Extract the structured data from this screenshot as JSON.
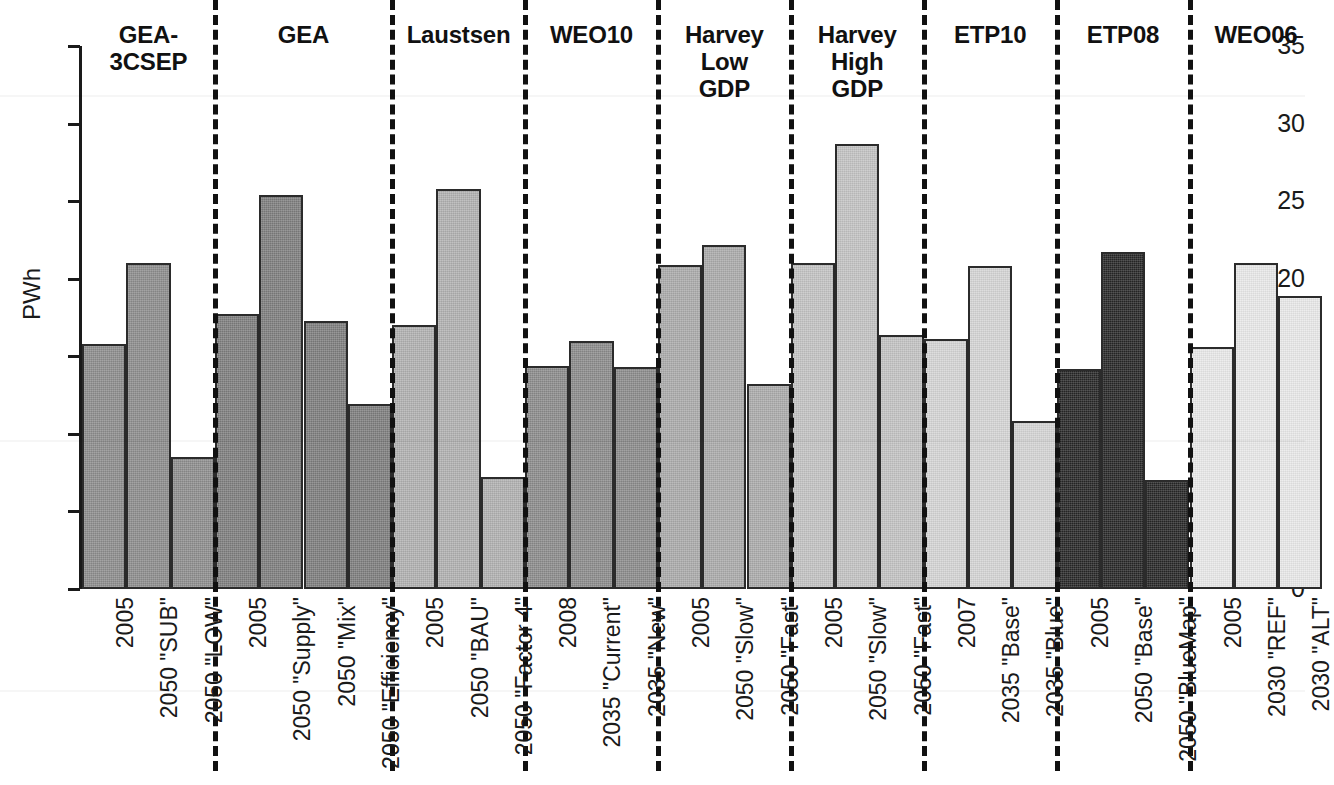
{
  "chart_data": {
    "type": "bar",
    "title": "",
    "xlabel": "",
    "ylabel": "PWh",
    "ylim": [
      0,
      35
    ],
    "yticks": [
      0,
      5,
      10,
      15,
      20,
      25,
      30,
      35
    ],
    "grid": false,
    "legend": "none",
    "units": "PWh",
    "axis_color": "#1a1a1a",
    "divider_style": "dashed",
    "groups": [
      {
        "name": "GEA-3CSEP",
        "color": "#8c8c8c",
        "categories": [
          "2005",
          "2050 \"SUB\"",
          "2050 \"LOW\""
        ],
        "values": [
          15.8,
          21.0,
          8.5
        ]
      },
      {
        "name": "GEA",
        "color": "#7d7d7d",
        "categories": [
          "2005",
          "2050 \"Supply\"",
          "2050 \"Mix\"",
          "2050 \"Efficiency\""
        ],
        "values": [
          17.7,
          25.4,
          17.3,
          11.9
        ]
      },
      {
        "name": "Laustsen",
        "color": "#b0b0b0",
        "categories": [
          "2005",
          "2050 \"BAU\"",
          "2050 \"Factor 4\""
        ],
        "values": [
          17.0,
          25.8,
          7.2
        ]
      },
      {
        "name": "WEO10",
        "color": "#8a8a8a",
        "categories": [
          "2008",
          "2035 \"Current\"",
          "2035 \"New\""
        ],
        "values": [
          14.4,
          16.0,
          14.3
        ]
      },
      {
        "name": "Harvey Low GDP",
        "color": "#aaaaaa",
        "categories": [
          "2005",
          "2050 \"Slow\"",
          "2050 \"Fast\""
        ],
        "values": [
          20.9,
          22.2,
          13.2
        ]
      },
      {
        "name": "Harvey High GDP",
        "color": "#c2c2c2",
        "categories": [
          "2005",
          "2050 \"Slow\"",
          "2050 \"Fast\""
        ],
        "values": [
          21.0,
          28.7,
          16.4
        ]
      },
      {
        "name": "ETP10",
        "color": "#d4d4d4",
        "categories": [
          "2007",
          "2035 \"Base\"",
          "2035 \"Blue\""
        ],
        "values": [
          16.1,
          20.8,
          10.8
        ]
      },
      {
        "name": "ETP08",
        "color": "#262626",
        "categories": [
          "2005",
          "2050 \"Base\"",
          "2050 \"BlueMap\""
        ],
        "values": [
          14.2,
          21.7,
          7.0
        ]
      },
      {
        "name": "WEO06",
        "color": "#e8e8e8",
        "categories": [
          "2005",
          "2030 \"REF\"",
          "2030 \"ALT\""
        ],
        "values": [
          15.6,
          21.0,
          18.9
        ]
      }
    ]
  },
  "group_header_lines": {
    "GEA-3CSEP": [
      "GEA-",
      "3CSEP"
    ],
    "GEA": [
      "GEA"
    ],
    "Laustsen": [
      "Laustsen"
    ],
    "WEO10": [
      "WEO10"
    ],
    "Harvey Low GDP": [
      "Harvey",
      "Low",
      "GDP"
    ],
    "Harvey High GDP": [
      "Harvey",
      "High",
      "GDP"
    ],
    "ETP10": [
      "ETP10"
    ],
    "ETP08": [
      "ETP08"
    ],
    "WEO06": [
      "WEO06"
    ]
  }
}
